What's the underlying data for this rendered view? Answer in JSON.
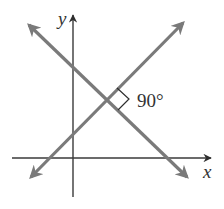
{
  "diagram": {
    "axes": {
      "x_label": "x",
      "y_label": "y"
    },
    "lines": [
      {
        "name": "line-negative-slope",
        "direction": "decreasing",
        "color": "#7a7a7a"
      },
      {
        "name": "line-positive-slope",
        "direction": "increasing",
        "color": "#7a7a7a"
      }
    ],
    "angle": {
      "label": "90°",
      "marker": "right-angle"
    },
    "colors": {
      "axis": "#3a3a3a",
      "lines": "#7a7a7a",
      "text": "#333333",
      "background": "#ffffff"
    }
  }
}
